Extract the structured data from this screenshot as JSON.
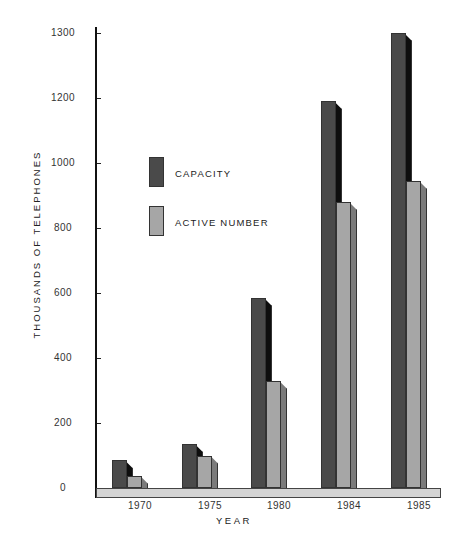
{
  "chart_data": {
    "type": "bar",
    "title": "",
    "xlabel": "YEAR",
    "ylabel": "THOUSANDS OF TELEPHONES",
    "categories": [
      "1970",
      "1975",
      "1980",
      "1984",
      "1985"
    ],
    "series": [
      {
        "name": "CAPACITY",
        "color": "#4a4a4a",
        "values": [
          85,
          135,
          585,
          1190,
          1300
        ]
      },
      {
        "name": "ACTIVE NUMBER",
        "color": "#a6a6a6",
        "values": [
          38,
          100,
          330,
          880,
          945
        ]
      }
    ],
    "yticks": [
      "0",
      "200",
      "400",
      "600",
      "800",
      "1000",
      "1200",
      "1300"
    ],
    "ylim": [
      0,
      1300
    ],
    "axis_note": "broken axis: 1200 to 1300 spans same height as 200-unit intervals",
    "grid": false,
    "legend_position": "upper-left inside plot",
    "style": "3D shaded bars on floor slab"
  },
  "legend": {
    "items": [
      {
        "label": "CAPACITY"
      },
      {
        "label": "ACTIVE NUMBER"
      }
    ]
  }
}
